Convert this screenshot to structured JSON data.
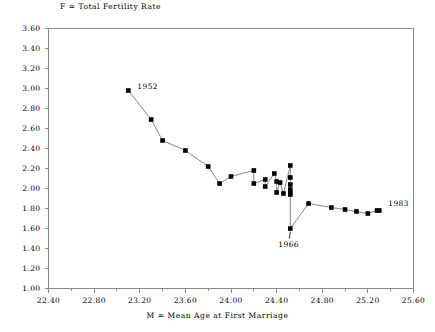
{
  "chart_data": {
    "type": "line",
    "title": "F = Total Fertility Rate",
    "xlabel": "M = Mean Age at First Marriage",
    "ylabel": "F = Total Fertility Rate",
    "xlim": [
      22.4,
      25.6
    ],
    "ylim": [
      1.0,
      3.6
    ],
    "xticks": [
      "22.40",
      "22.80",
      "23.20",
      "23.60",
      "24.00",
      "24.40",
      "24.80",
      "25.20",
      "25.60"
    ],
    "yticks": [
      "3.60",
      "3.40",
      "3.20",
      "3.00",
      "2.80",
      "2.60",
      "2.40",
      "2.20",
      "2.00",
      "1.80",
      "1.60",
      "1.40",
      "1.20",
      "1.00"
    ],
    "xtick_values": [
      22.4,
      22.8,
      23.2,
      23.6,
      24.0,
      24.4,
      24.8,
      25.2,
      25.6
    ],
    "ytick_values": [
      3.6,
      3.4,
      3.2,
      3.0,
      2.8,
      2.6,
      2.4,
      2.2,
      2.0,
      1.8,
      1.6,
      1.4,
      1.2,
      1.0
    ],
    "minor_tick_step_x": 0.2,
    "grid": false,
    "legend": null,
    "marker": "filled-square",
    "marker_color": "#000000",
    "line_color": "#7a7a7a",
    "axis_color": "#8a8a8a",
    "series": [
      {
        "name": "Mean Age at First Marriage vs Total Fertility Rate",
        "x": [
          23.1,
          23.3,
          23.4,
          23.6,
          23.8,
          23.9,
          24.0,
          24.2,
          24.2,
          24.3,
          24.3,
          24.38,
          24.4,
          24.4,
          24.43,
          24.46,
          24.52,
          24.52,
          24.52,
          24.52,
          24.52,
          24.52,
          24.52,
          24.68,
          24.88,
          25.0,
          25.1,
          25.2,
          25.28,
          25.3
        ],
        "y": [
          2.98,
          2.69,
          2.48,
          2.38,
          2.22,
          2.05,
          2.12,
          2.18,
          2.05,
          2.09,
          2.02,
          2.15,
          2.07,
          1.96,
          2.06,
          1.95,
          2.23,
          2.11,
          2.04,
          1.99,
          1.96,
          1.94,
          1.6,
          1.85,
          1.81,
          1.79,
          1.77,
          1.75,
          1.78,
          1.78
        ]
      }
    ],
    "annotations": [
      {
        "label": "1952",
        "x": 23.1,
        "y": 2.98,
        "dx": 9,
        "dy": -5
      },
      {
        "label": "1966",
        "x": 24.52,
        "y": 1.6,
        "dx": -1,
        "dy": 15
      },
      {
        "label": "1983",
        "x": 25.3,
        "y": 1.78,
        "dx": 9,
        "dy": -8
      }
    ]
  }
}
